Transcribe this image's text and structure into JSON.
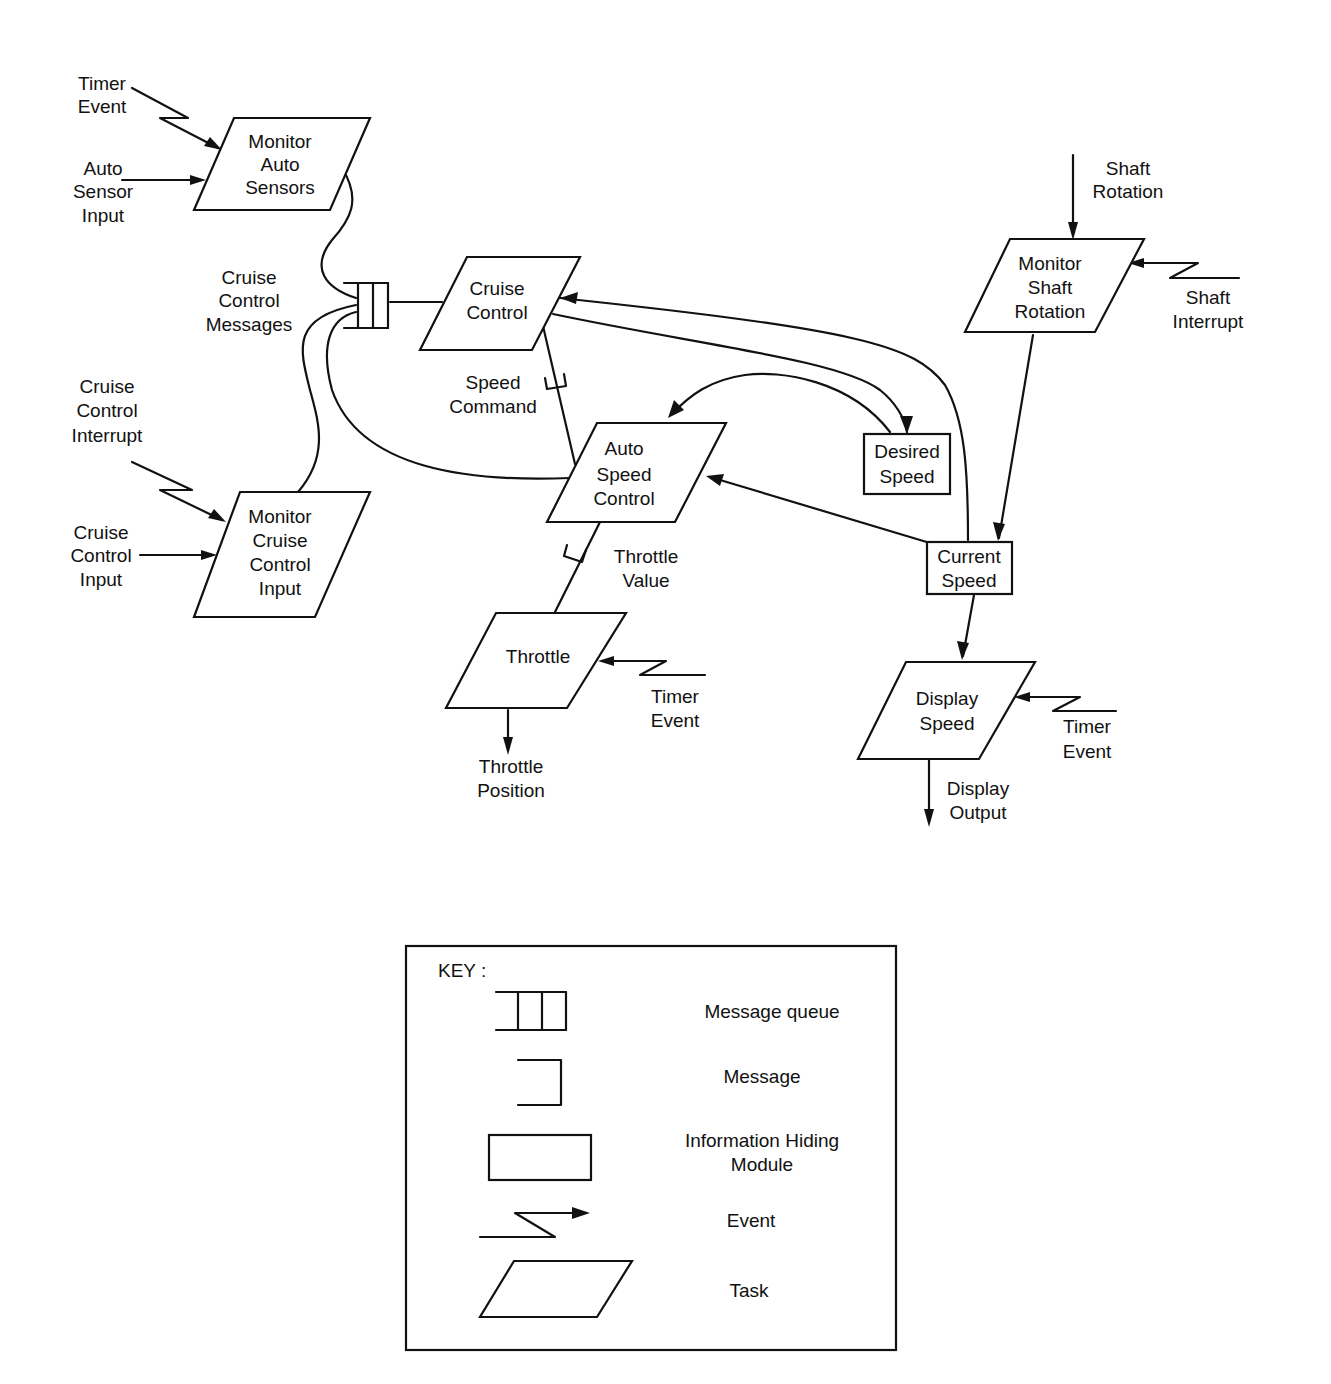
{
  "diagram": {
    "colors": {
      "ink": "#111111",
      "background": "#ffffff"
    },
    "tasks": [
      {
        "id": "monitor-auto-sensors",
        "lines": [
          "Monitor",
          "Auto",
          "Sensors"
        ]
      },
      {
        "id": "cruise-control",
        "lines": [
          "Cruise",
          "Control"
        ]
      },
      {
        "id": "monitor-shaft-rotation",
        "lines": [
          "Monitor",
          "Shaft",
          "Rotation"
        ]
      },
      {
        "id": "auto-speed-control",
        "lines": [
          "Auto",
          "Speed",
          "Control"
        ]
      },
      {
        "id": "monitor-cruise-control-input",
        "lines": [
          "Monitor",
          "Cruise",
          "Control",
          "Input"
        ]
      },
      {
        "id": "throttle",
        "lines": [
          "Throttle"
        ]
      },
      {
        "id": "display-speed",
        "lines": [
          "Display",
          "Speed"
        ]
      }
    ],
    "modules": [
      {
        "id": "desired-speed",
        "lines": [
          "Desired",
          "Speed"
        ]
      },
      {
        "id": "current-speed",
        "lines": [
          "Current",
          "Speed"
        ]
      }
    ],
    "message_queue": {
      "id": "cruise-control-messages",
      "lines": [
        "Cruise",
        "Control",
        "Messages"
      ]
    },
    "messages": [
      {
        "id": "speed-command",
        "lines": [
          "Speed",
          "Command"
        ]
      },
      {
        "id": "throttle-value",
        "lines": [
          "Throttle",
          "Value"
        ]
      }
    ],
    "labels": {
      "timer_event_1": [
        "Timer",
        "Event"
      ],
      "auto_sensor_input": [
        "Auto",
        "Sensor",
        "Input"
      ],
      "shaft_rotation": [
        "Shaft",
        "Rotation"
      ],
      "shaft_interrupt": [
        "Shaft",
        "Interrupt"
      ],
      "cruise_control_interrupt": [
        "Cruise",
        "Control",
        "Interrupt"
      ],
      "cruise_control_input": [
        "Cruise",
        "Control",
        "Input"
      ],
      "timer_event_2": [
        "Timer",
        "Event"
      ],
      "throttle_position": [
        "Throttle",
        "Position"
      ],
      "timer_event_3": [
        "Timer",
        "Event"
      ],
      "display_output": [
        "Display",
        "Output"
      ]
    }
  },
  "key": {
    "title": "KEY :",
    "items": [
      {
        "symbol": "message-queue",
        "lines": [
          "Message queue"
        ]
      },
      {
        "symbol": "message",
        "lines": [
          "Message"
        ]
      },
      {
        "symbol": "information-hiding-module",
        "lines": [
          "Information Hiding",
          "Module"
        ]
      },
      {
        "symbol": "event",
        "lines": [
          "Event"
        ]
      },
      {
        "symbol": "task",
        "lines": [
          "Task"
        ]
      }
    ]
  }
}
